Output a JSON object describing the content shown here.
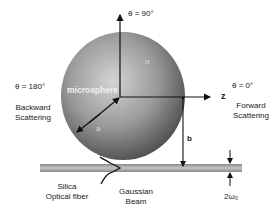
{
  "diagram": {
    "sphere": {
      "label": "microsphere",
      "index_label": "n",
      "radius_label": "a",
      "fill_light": "#d8d8d8",
      "fill_dark": "#555555"
    },
    "angles": {
      "top": "θ = 90°",
      "left": "θ = 180°",
      "right": "θ = 0°"
    },
    "axis": {
      "z_label": "z"
    },
    "scattering": {
      "backward_line1": "Backward",
      "backward_line2": "Scattering",
      "forward_line1": "Forward",
      "forward_line2": "Scattering"
    },
    "fiber": {
      "line1": "Silica",
      "line2": "Optical fiber",
      "color": "#9a9a9a"
    },
    "beam": {
      "line1": "Gaussian",
      "line2": "Beam"
    },
    "distance_label": "b",
    "waist_label": "2ω₀"
  }
}
